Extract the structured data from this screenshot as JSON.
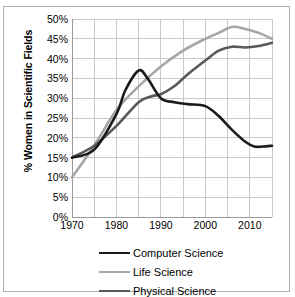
{
  "chart_data": {
    "type": "line",
    "title": "",
    "xlabel": "",
    "ylabel": "% Women in Scientific Fields",
    "xlim": [
      1970,
      2015
    ],
    "ylim": [
      0,
      50
    ],
    "grid": true,
    "legend_position": "bottom",
    "x_ticks": [
      1970,
      1980,
      1990,
      2000,
      2010
    ],
    "x_tick_labels": [
      "1970",
      "1980",
      "1990",
      "2000",
      "2010"
    ],
    "x_gridlines": [
      1970,
      1975,
      1980,
      1985,
      1990,
      1995,
      2000,
      2005,
      2010,
      2015
    ],
    "y_ticks": [
      0,
      5,
      10,
      15,
      20,
      25,
      30,
      35,
      40,
      45,
      50
    ],
    "y_tick_labels": [
      "0%",
      "5%",
      "10%",
      "15%",
      "20%",
      "25%",
      "30%",
      "35%",
      "40%",
      "45%",
      "50%"
    ],
    "series": [
      {
        "name": "Computer Science",
        "color": "#1a1a1a",
        "width": 2.6,
        "x": [
          1970,
          1975,
          1980,
          1982,
          1985,
          1987,
          1990,
          1993,
          1996,
          2000,
          2003,
          2006,
          2009,
          2011,
          2013,
          2015
        ],
        "values": [
          15,
          17,
          26,
          32,
          37,
          35,
          30,
          29,
          28.5,
          28,
          25.5,
          22,
          19,
          17.8,
          17.8,
          18
        ]
      },
      {
        "name": "Life Science",
        "color": "#a6a6a6",
        "width": 2.6,
        "x": [
          1970,
          1975,
          1980,
          1985,
          1990,
          1995,
          2000,
          2003,
          2006,
          2009,
          2012,
          2015
        ],
        "values": [
          10,
          18,
          27,
          33,
          38,
          42,
          45,
          46.5,
          48,
          47.5,
          46.5,
          45
        ]
      },
      {
        "name": "Physical Science",
        "color": "#595959",
        "width": 2.6,
        "x": [
          1970,
          1975,
          1980,
          1985,
          1988,
          1990,
          1993,
          1996,
          2000,
          2003,
          2006,
          2009,
          2012,
          2015
        ],
        "values": [
          15,
          18,
          23,
          29,
          30.5,
          31,
          33,
          36,
          39.5,
          42,
          43,
          42.8,
          43.2,
          44
        ]
      }
    ]
  },
  "axis": {
    "y_title": "% Women in Scientific Fields"
  },
  "legend": {
    "items": [
      {
        "label": "Computer Science"
      },
      {
        "label": "Life Science"
      },
      {
        "label": "Physical Science"
      }
    ]
  }
}
